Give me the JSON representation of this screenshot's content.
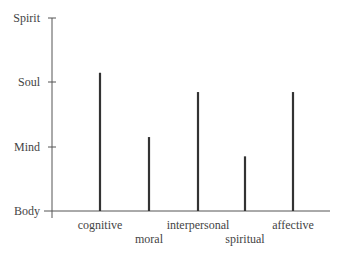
{
  "chart_data": {
    "type": "bar",
    "title": "",
    "xlabel": "",
    "ylabel": "",
    "y_levels": [
      "Body",
      "Mind",
      "Soul",
      "Spirit"
    ],
    "ylim": [
      0,
      3
    ],
    "categories": [
      "cognitive",
      "moral",
      "interpersonal",
      "spiritual",
      "affective"
    ],
    "values": [
      2.15,
      1.15,
      1.85,
      0.85,
      1.85
    ],
    "grid": false,
    "legend": "none",
    "bar_color": "#333333"
  },
  "axis": {
    "y_labels": [
      "Spirit",
      "Soul",
      "Mind",
      "Body"
    ],
    "x_labels": [
      "cognitive",
      "moral",
      "interpersonal",
      "spiritual",
      "affective"
    ]
  }
}
